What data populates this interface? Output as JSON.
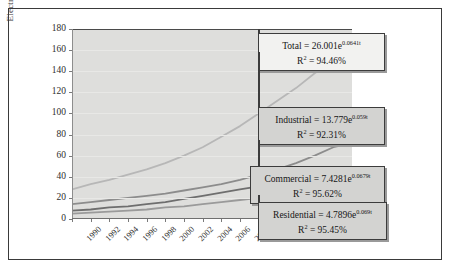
{
  "figure": {
    "type": "line-chart-figure",
    "background": "#ffffff",
    "plot_background": "#dededc"
  },
  "chart_data": {
    "type": "line",
    "title": "",
    "xlabel": "",
    "ylabel": "Electricity Consumption (kWh)",
    "ylabel_line1": "Electricity Consumption",
    "ylabel_line2": "(kWh)",
    "grid": true,
    "legend_position": "annotations-right",
    "xlim": [
      1990,
      2020
    ],
    "ylim": [
      0,
      180
    ],
    "ytick_step": 20,
    "xtick_step": 2,
    "categories": [
      1990,
      1992,
      1994,
      1996,
      1998,
      2000,
      2002,
      2004,
      2006,
      2008,
      2010,
      2012,
      2014,
      2016,
      2018,
      2020
    ],
    "xticklabels": [
      "1990",
      "1992",
      "1994",
      "1996",
      "1998",
      "2000",
      "2002",
      "2004",
      "2006",
      "2008",
      "2010",
      "2012",
      "2014",
      "2016",
      "2018",
      "2020"
    ],
    "yticklabels": [
      "0",
      "20",
      "40",
      "60",
      "80",
      "100",
      "120",
      "140",
      "160",
      "180"
    ],
    "yticks": [
      0,
      20,
      40,
      60,
      80,
      100,
      120,
      140,
      160,
      180
    ],
    "series": [
      {
        "name": "Total",
        "color": "#b7b7b7",
        "values": [
          28,
          33,
          37,
          42,
          47,
          53,
          60,
          68,
          78,
          88,
          100,
          112,
          124,
          138,
          150,
          152
        ]
      },
      {
        "name": "Industrial",
        "color": "#8c8c8c",
        "values": [
          14,
          16,
          18,
          20,
          22,
          24,
          27,
          30,
          33,
          37,
          42,
          47,
          53,
          60,
          68,
          72
        ]
      },
      {
        "name": "Commercial",
        "color": "#6e6e6e",
        "values": [
          8,
          9,
          11,
          12,
          14,
          16,
          19,
          22,
          25,
          28,
          31,
          34,
          38,
          43,
          47,
          49
        ]
      },
      {
        "name": "Residential",
        "color": "#9a9a9a",
        "values": [
          5,
          6,
          7,
          8,
          9,
          11,
          12,
          14,
          16,
          18,
          20,
          22,
          24,
          27,
          29,
          30
        ]
      }
    ],
    "annotations": [
      {
        "id": "total",
        "name": "Total",
        "equation_prefix": "Total = 26.001e",
        "equation_exponent": "0.0641t",
        "r2_label": "R",
        "r2_sup": "2",
        "r2_value": "= 94.46%",
        "r2_full": "R2 = 94.46%",
        "coefficient": 26.001,
        "rate": 0.0641,
        "r2": 94.46,
        "style": "light"
      },
      {
        "id": "industrial",
        "name": "Industrial",
        "equation_prefix": "Industrial = 13.779e",
        "equation_exponent": "0.059t",
        "r2_label": "R",
        "r2_sup": "2",
        "r2_value": "= 92.31%",
        "r2_full": "R2 = 92.31%",
        "coefficient": 13.779,
        "rate": 0.059,
        "r2": 92.31,
        "style": "dark"
      },
      {
        "id": "commercial",
        "name": "Commercial",
        "equation_prefix": "Commercial = 7.4281e",
        "equation_exponent": "0.0679t",
        "r2_label": "R",
        "r2_sup": "2",
        "r2_value": "= 95.62%",
        "r2_full": "R2 = 95.62%",
        "coefficient": 7.4281,
        "rate": 0.0679,
        "r2": 95.62,
        "style": "dark"
      },
      {
        "id": "residential",
        "name": "Residential",
        "equation_prefix": "Residential = 4.7896e",
        "equation_exponent": "0.069t",
        "r2_label": "R",
        "r2_sup": "2",
        "r2_value": "= 95.45%",
        "r2_full": "R2 = 95.45%",
        "coefficient": 4.7896,
        "rate": 0.069,
        "r2": 95.45,
        "style": "dark"
      }
    ]
  }
}
